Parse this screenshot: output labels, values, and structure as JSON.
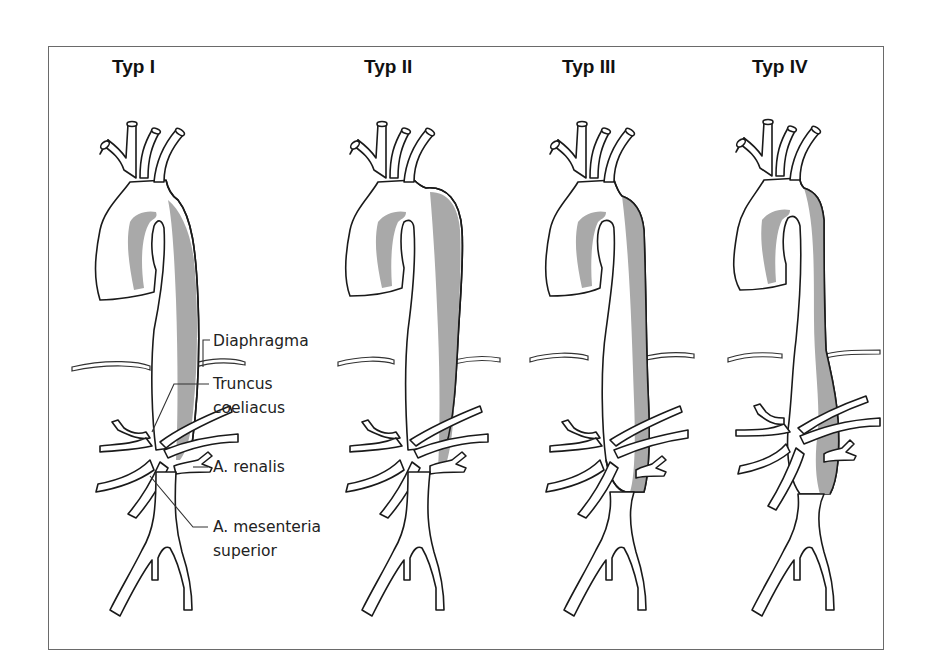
{
  "figure": {
    "panels": [
      {
        "id": "typ-1",
        "title": "Typ I"
      },
      {
        "id": "typ-2",
        "title": "Typ II"
      },
      {
        "id": "typ-3",
        "title": "Typ III"
      },
      {
        "id": "typ-4",
        "title": "Typ IV"
      }
    ],
    "labels": {
      "diaphragma": "Diaphragma",
      "truncus_line1": "Truncus",
      "truncus_line2": "coeliacus",
      "renalis": "A. renalis",
      "mesenteria_line1": "A. mesenteria",
      "mesenteria_line2": "superior"
    },
    "colors": {
      "outline": "#1a1a1a",
      "false_lumen": "#a9a9a9",
      "background": "#ffffff",
      "frame": "#6a6a6a"
    }
  }
}
